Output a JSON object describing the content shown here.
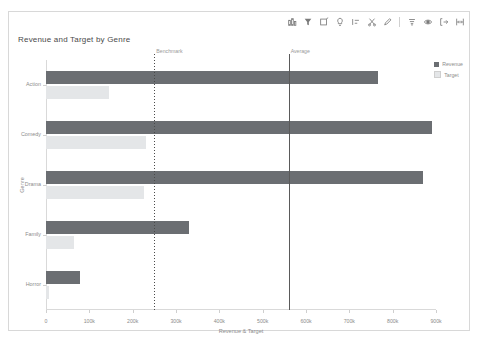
{
  "toolbar": {
    "icons": [
      {
        "name": "data-source-icon",
        "label": "Data source"
      },
      {
        "name": "filter-funnel-icon",
        "label": "Filter"
      },
      {
        "name": "edit-square-icon",
        "label": "Edit"
      },
      {
        "name": "lightbulb-icon",
        "label": "Insights"
      },
      {
        "name": "align-left-icon",
        "label": "Align"
      },
      {
        "name": "scissors-icon",
        "label": "Cut"
      },
      {
        "name": "pencil-edit-icon",
        "label": "Annotate"
      },
      {
        "name": "sort-icon",
        "label": "Sort"
      },
      {
        "name": "eye-icon",
        "label": "View"
      },
      {
        "name": "export-arrow-icon",
        "label": "Export"
      },
      {
        "name": "fullscreen-icon",
        "label": "Full screen"
      }
    ]
  },
  "chart_data": {
    "type": "bar",
    "orientation": "horizontal",
    "title": "Revenue and Target by Genre",
    "xlabel": "Revenue & Target",
    "ylabel": "Genre",
    "categories": [
      "Action",
      "Comedy",
      "Drama",
      "Family",
      "Horror"
    ],
    "series": [
      {
        "name": "Revenue",
        "color": "#6b6e72",
        "values": [
          765000,
          890000,
          870000,
          330000,
          78000
        ]
      },
      {
        "name": "Target",
        "color": "#e4e6e8",
        "values": [
          145000,
          230000,
          225000,
          65000,
          8000
        ]
      }
    ],
    "xlim": [
      0,
      900000
    ],
    "xticks": [
      0,
      100000,
      200000,
      300000,
      400000,
      500000,
      600000,
      700000,
      800000,
      900000
    ],
    "xticklabels": [
      "0",
      "100k",
      "200k",
      "300k",
      "400k",
      "500k",
      "600k",
      "700k",
      "800k",
      "900k"
    ],
    "grid": false,
    "legend_position": "right-top",
    "reference_lines": [
      {
        "name": "Benchmark",
        "label": "Benchmark",
        "value": 250000,
        "style": "dotted",
        "color": "#4a4a4a"
      },
      {
        "name": "Average",
        "label": "Average",
        "value": 560000,
        "style": "solid",
        "color": "#5a5a5a"
      }
    ]
  }
}
